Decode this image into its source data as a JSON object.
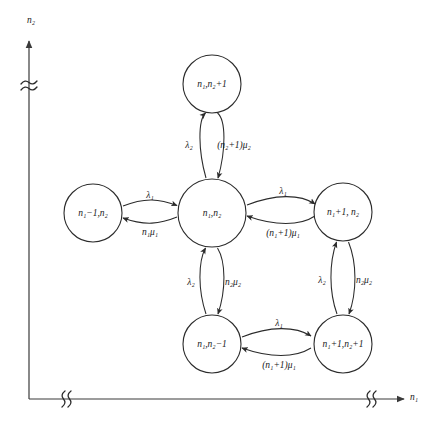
{
  "diagram": {
    "type": "markov-state-transition-diagram",
    "axes": {
      "x": {
        "label": "n",
        "label_sub": "1",
        "label_full": "n₁",
        "name": "x-axis-n1",
        "breaks": 2
      },
      "y": {
        "label": "n",
        "label_sub": "2",
        "label_full": "n₂",
        "name": "y-axis-n2",
        "breaks": 1
      }
    },
    "nodes": [
      {
        "id": "top",
        "label_a": "n",
        "sub_a": "1",
        "sep": ",",
        "label_b": "n",
        "sub_b": "2",
        "tail": "+1",
        "text": "n₁,n₂+1",
        "cx": 212,
        "cy": 84,
        "r": 29
      },
      {
        "id": "left",
        "label_a": "n",
        "sub_a": "1",
        "sep": "",
        "label_b": "n",
        "sub_b": "2",
        "tail": "",
        "text": "n₁−1,n₂",
        "cx": 93,
        "cy": 213,
        "r": 29
      },
      {
        "id": "center",
        "label_a": "n",
        "sub_a": "1",
        "sep": ",",
        "label_b": "n",
        "sub_b": "2",
        "tail": "",
        "text": "n₁,n₂",
        "cx": 212,
        "cy": 213,
        "r": 34
      },
      {
        "id": "right",
        "label_a": "n",
        "sub_a": "1",
        "sep": ",",
        "label_b": "n",
        "sub_b": "2",
        "tail": "",
        "text": "n₁+1, n₂",
        "cx": 343,
        "cy": 212,
        "r": 29
      },
      {
        "id": "bottom",
        "label_a": "n",
        "sub_a": "1",
        "sep": ",",
        "label_b": "n",
        "sub_b": "2",
        "tail": "−1",
        "text": "n₁,n₂−1",
        "cx": 212,
        "cy": 344,
        "r": 29
      },
      {
        "id": "bottomright",
        "label_a": "n",
        "sub_a": "1",
        "sep": ",",
        "label_b": "n",
        "sub_b": "2",
        "tail": "+1",
        "text": "n₁+1,n₂+1",
        "cx": 343,
        "cy": 344,
        "r": 29
      }
    ],
    "edge_labels": {
      "lambda1": "λ₁",
      "lambda2": "λ₂",
      "n1mu1": "n₁μ₁",
      "n2mu2": "n₂μ₂",
      "n1p1mu1": "(n₁+1)μ₁",
      "n2p1mu2": "(n₂+1)μ₂"
    },
    "edges": [
      {
        "id": "center-to-top",
        "from": "center",
        "to": "top",
        "rate": "λ₂",
        "direction": "up"
      },
      {
        "id": "top-to-center",
        "from": "top",
        "to": "center",
        "rate": "(n₂+1)μ₂",
        "direction": "down"
      },
      {
        "id": "left-to-center",
        "from": "left",
        "to": "center",
        "rate": "λ₁",
        "direction": "right"
      },
      {
        "id": "center-to-left",
        "from": "center",
        "to": "left",
        "rate": "n₁μ₁",
        "direction": "left"
      },
      {
        "id": "center-to-right",
        "from": "center",
        "to": "right",
        "rate": "λ₁",
        "direction": "right"
      },
      {
        "id": "right-to-center",
        "from": "right",
        "to": "center",
        "rate": "(n₁+1)μ₁",
        "direction": "left"
      },
      {
        "id": "bottom-to-center",
        "from": "bottom",
        "to": "center",
        "rate": "λ₂",
        "direction": "up"
      },
      {
        "id": "center-to-bottom",
        "from": "center",
        "to": "bottom",
        "rate": "n₂μ₂",
        "direction": "down"
      },
      {
        "id": "bottomright-to-right",
        "from": "bottomright",
        "to": "right",
        "rate": "λ₂",
        "direction": "up"
      },
      {
        "id": "right-to-bottomright",
        "from": "right",
        "to": "bottomright",
        "rate": "n₂μ₂",
        "direction": "down"
      },
      {
        "id": "bottom-to-bottomright",
        "from": "bottom",
        "to": "bottomright",
        "rate": "λ₁",
        "direction": "right"
      },
      {
        "id": "bottomright-to-bottom",
        "from": "bottomright",
        "to": "bottom",
        "rate": "(n₁+1)μ₁",
        "direction": "left"
      }
    ],
    "colors": {
      "stroke": "#2b2b2b",
      "axis": "#3a3a3a",
      "text": "#1a1a1a",
      "background": "#ffffff"
    }
  }
}
